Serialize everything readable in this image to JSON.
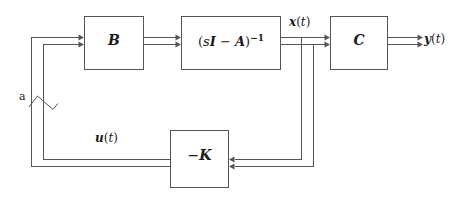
{
  "figure": {
    "kind": "control-system-block-diagram",
    "background_color": "#ffffff",
    "line_color": "#555555",
    "text_color": "#1a1a1a",
    "box_fill": "#ffffff"
  },
  "blocks": {
    "b": {
      "id": "B",
      "label": "B",
      "x": 84,
      "y": 16,
      "w": 60,
      "h": 54
    },
    "plant": {
      "id": "sI-A-inverse",
      "label_open_paren": "(",
      "label_s": "s",
      "label_I": "I",
      "label_minus": " − ",
      "label_A": "A",
      "label_close_paren": ")",
      "label_exponent": "−1",
      "label_plain": "(sI − A)⁻¹",
      "x": 181,
      "y": 16,
      "w": 100,
      "h": 54
    },
    "c": {
      "id": "C",
      "label": "C",
      "x": 330,
      "y": 16,
      "w": 58,
      "h": 54
    },
    "k": {
      "id": "-K",
      "label_minus": "−",
      "label_K": "K",
      "label_plain": "−K",
      "x": 170,
      "y": 130,
      "w": 59,
      "h": 58
    }
  },
  "signals": {
    "state": {
      "name": "state-vector",
      "vec": "x",
      "paren_open": "(",
      "ital_t": "t",
      "paren_close": ")",
      "plain": "x(t)"
    },
    "output": {
      "name": "output-vector",
      "vec": "y",
      "paren_open": "(",
      "ital_t": "t",
      "paren_close": ")",
      "plain": "y(t)"
    },
    "input": {
      "name": "control-input-vector",
      "vec": "u",
      "paren_open": "(",
      "ital_t": "t",
      "paren_close": ")",
      "plain": "u(t)"
    },
    "bus_annotation": {
      "name": "bus-width-annotation",
      "label": "a"
    }
  },
  "geometry": {
    "bus_gap": 7,
    "stroke_width": 1,
    "arrow_len": 5,
    "arrow_half_height": 3,
    "rows": {
      "bus_top_y": 37,
      "bus_bottom_y": 44,
      "feedback_top_y": 159,
      "feedback_bottom_y": 166
    },
    "columns": {
      "left_outer_x": 31,
      "left_inner_x": 43,
      "right_outer_x": 313,
      "right_inner_x": 301
    }
  }
}
